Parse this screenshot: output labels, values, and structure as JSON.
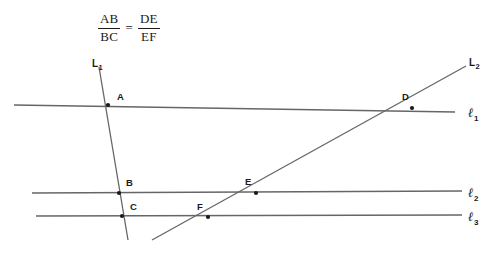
{
  "figure": {
    "type": "geometry-diagram",
    "width": 501,
    "height": 269,
    "background_color": "#ffffff",
    "line_color": "#666666",
    "text_color": "#1a1a1a"
  },
  "equation": {
    "left_fraction": {
      "numerator": "AB",
      "denominator": "BC"
    },
    "relation": "=",
    "right_fraction": {
      "numerator": "DE",
      "denominator": "EF"
    },
    "plain_text": "AB/BC = DE/EF"
  },
  "transversals": [
    {
      "name": "L1",
      "label_text": "L",
      "label_sub": "1",
      "label_x": 92,
      "label_y": 58,
      "x1": 99,
      "y1": 67,
      "x2": 128,
      "y2": 240
    },
    {
      "name": "L2",
      "label_text": "L",
      "label_sub": "2",
      "label_x": 469,
      "label_y": 57,
      "x1": 152,
      "y1": 240,
      "x2": 466,
      "y2": 66
    }
  ],
  "parallel_lines": [
    {
      "name": "ell1",
      "label_text": "ℓ",
      "label_sub": "1",
      "label_x": 468,
      "label_y": 105,
      "x1": 14,
      "y1": 105,
      "x2": 455,
      "y2": 112
    },
    {
      "name": "ell2",
      "label_text": "ℓ",
      "label_sub": "2",
      "label_x": 468,
      "label_y": 185,
      "x1": 32,
      "y1": 193,
      "x2": 462,
      "y2": 191
    },
    {
      "name": "ell3",
      "label_text": "ℓ",
      "label_sub": "3",
      "label_x": 468,
      "label_y": 209,
      "x1": 36,
      "y1": 216,
      "x2": 462,
      "y2": 215
    }
  ],
  "points": [
    {
      "name": "A",
      "label": "A",
      "x": 108,
      "y": 105,
      "label_x": 117,
      "label_y": 91,
      "on": "L1 ∩ ℓ1"
    },
    {
      "name": "B",
      "label": "B",
      "x": 119,
      "y": 193,
      "label_x": 126,
      "label_y": 177,
      "on": "L1 ∩ ℓ2"
    },
    {
      "name": "C",
      "label": "C",
      "x": 122,
      "y": 216,
      "label_x": 130,
      "label_y": 201,
      "on": "L1 ∩ ℓ3"
    },
    {
      "name": "D",
      "label": "D",
      "x": 412,
      "y": 108,
      "label_x": 402,
      "label_y": 91,
      "on": "L2 ∩ ℓ1"
    },
    {
      "name": "E",
      "label": "E",
      "x": 256,
      "y": 193,
      "label_x": 245,
      "label_y": 176,
      "on": "L2 ∩ ℓ2"
    },
    {
      "name": "F",
      "label": "F",
      "x": 208,
      "y": 217,
      "label_x": 197,
      "label_y": 201,
      "on": "L2 ∩ ℓ3"
    }
  ]
}
